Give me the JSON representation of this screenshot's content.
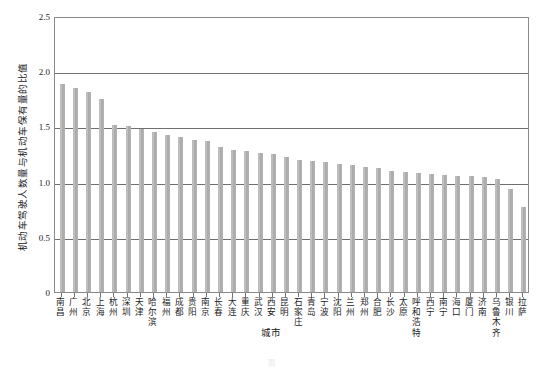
{
  "chart_data": {
    "type": "bar",
    "title": "",
    "xlabel": "城市",
    "ylabel": "机动车驾驶人数量与机动车保有量的比值",
    "ylim": [
      0,
      2.5
    ],
    "yticks": [
      0,
      0.5,
      1.0,
      1.5,
      2.0,
      2.5
    ],
    "ytick_labels": [
      "0",
      "0.5",
      "1.0",
      "1.5",
      "2.0",
      "2.5"
    ],
    "grid": "horizontal",
    "legend": "none",
    "bar_color": "#b0b0b0",
    "categories": [
      "南昌",
      "广州",
      "北京",
      "上海",
      "杭州",
      "深圳",
      "天津",
      "哈尔滨",
      "福州",
      "成都",
      "贵阳",
      "南京",
      "长春",
      "大连",
      "重庆",
      "武汉",
      "西安",
      "昆明",
      "石家庄",
      "青岛",
      "宁波",
      "沈阳",
      "兰州",
      "郑州",
      "合肥",
      "长沙",
      "太原",
      "呼和浩特",
      "西宁",
      "南宁",
      "海口",
      "厦门",
      "济南",
      "乌鲁木齐",
      "银川",
      "拉萨"
    ],
    "values": [
      1.88,
      1.85,
      1.81,
      1.75,
      1.51,
      1.5,
      1.48,
      1.45,
      1.42,
      1.4,
      1.38,
      1.37,
      1.31,
      1.29,
      1.28,
      1.26,
      1.25,
      1.22,
      1.2,
      1.19,
      1.18,
      1.16,
      1.15,
      1.13,
      1.12,
      1.1,
      1.09,
      1.08,
      1.07,
      1.06,
      1.05,
      1.05,
      1.04,
      1.02,
      0.93,
      0.77
    ]
  },
  "caption": {
    "text": "图"
  }
}
